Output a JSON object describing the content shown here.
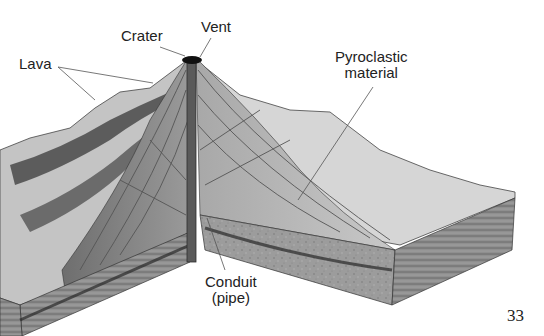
{
  "diagram": {
    "labels": {
      "crater": "Crater",
      "vent": "Vent",
      "lava": "Lava",
      "pyroclastic_line1": "Pyroclastic",
      "pyroclastic_line2": "material",
      "conduit_line1": "Conduit",
      "conduit_line2": "(pipe)"
    },
    "page_number": "33"
  },
  "colors": {
    "background": "#ffffff",
    "label_text": "#222222",
    "leader_line": "#555555",
    "rock_dark": "#3a3a3a",
    "rock_mid": "#7a7a7a",
    "rock_light": "#b8b8b8",
    "ground_light": "#d9d9d9"
  }
}
